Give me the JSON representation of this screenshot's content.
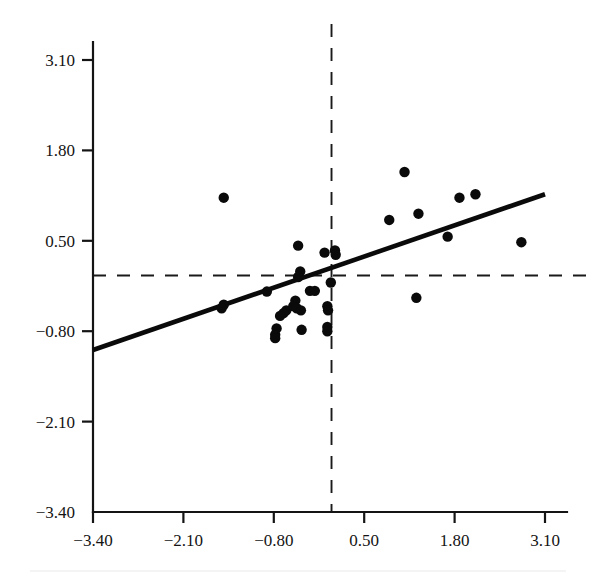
{
  "figure": {
    "title": "",
    "background_color": "#ffffff",
    "ink_color": "#0a0a0a"
  },
  "chart_data": {
    "type": "scatter",
    "title": "",
    "xlabel": "",
    "ylabel": "",
    "xlim": [
      -3.4,
      3.1
    ],
    "ylim": [
      -3.4,
      3.1
    ],
    "grid": false,
    "legend": null,
    "xticks": [
      -3.4,
      -2.1,
      -0.8,
      0.5,
      1.8,
      3.1
    ],
    "xtick_labels": [
      "-3.40",
      "-2.10",
      "-0.80",
      "0.50",
      "1.80",
      "3.10"
    ],
    "yticks": [
      -3.4,
      -2.1,
      -0.8,
      0.5,
      1.8,
      3.1
    ],
    "ytick_labels": [
      "-3.40",
      "-2.10",
      "-0.80",
      "0.50",
      "1.80",
      "3.10"
    ],
    "reference_lines": [
      {
        "name": "horizontal-mean-line",
        "orientation": "horizontal",
        "value": 0.0,
        "style": "dashed"
      },
      {
        "name": "vertical-mean-line",
        "orientation": "vertical",
        "value": 0.03,
        "style": "dashed"
      }
    ],
    "fit_line": {
      "name": "regression-line",
      "style": "solid",
      "x_start": -3.4,
      "y_start": -1.07,
      "x_end": 3.1,
      "y_end": 1.17,
      "slope": 0.345,
      "intercept": 0.105
    },
    "points": [
      {
        "x": -1.52,
        "y": 1.12
      },
      {
        "x": -0.45,
        "y": 0.43
      },
      {
        "x": -0.07,
        "y": 0.33
      },
      {
        "x": 0.08,
        "y": 0.36
      },
      {
        "x": 0.09,
        "y": 0.3
      },
      {
        "x": 1.08,
        "y": 1.49
      },
      {
        "x": 1.28,
        "y": 0.89
      },
      {
        "x": 0.86,
        "y": 0.8
      },
      {
        "x": 1.87,
        "y": 1.12
      },
      {
        "x": 2.1,
        "y": 1.17
      },
      {
        "x": 1.7,
        "y": 0.56
      },
      {
        "x": 2.76,
        "y": 0.48
      },
      {
        "x": 1.25,
        "y": -0.32
      },
      {
        "x": -0.42,
        "y": 0.06
      },
      {
        "x": -0.45,
        "y": -0.02
      },
      {
        "x": 0.02,
        "y": -0.1
      },
      {
        "x": -0.9,
        "y": -0.23
      },
      {
        "x": -1.52,
        "y": -0.42
      },
      {
        "x": -1.55,
        "y": -0.47
      },
      {
        "x": -0.28,
        "y": -0.22
      },
      {
        "x": -0.21,
        "y": -0.22
      },
      {
        "x": -0.49,
        "y": -0.36
      },
      {
        "x": -0.03,
        "y": -0.44
      },
      {
        "x": -0.02,
        "y": -0.5
      },
      {
        "x": -0.62,
        "y": -0.5
      },
      {
        "x": -0.66,
        "y": -0.54
      },
      {
        "x": -0.71,
        "y": -0.58
      },
      {
        "x": -0.52,
        "y": -0.44
      },
      {
        "x": -0.47,
        "y": -0.47
      },
      {
        "x": -0.41,
        "y": -0.5
      },
      {
        "x": -0.03,
        "y": -0.74
      },
      {
        "x": -0.03,
        "y": -0.8
      },
      {
        "x": -0.4,
        "y": -0.78
      },
      {
        "x": -0.76,
        "y": -0.76
      },
      {
        "x": -0.78,
        "y": -0.85
      },
      {
        "x": -0.78,
        "y": -0.9
      }
    ]
  },
  "axes": {
    "y_axis_name": "y-axis",
    "x_axis_name": "x-axis"
  }
}
